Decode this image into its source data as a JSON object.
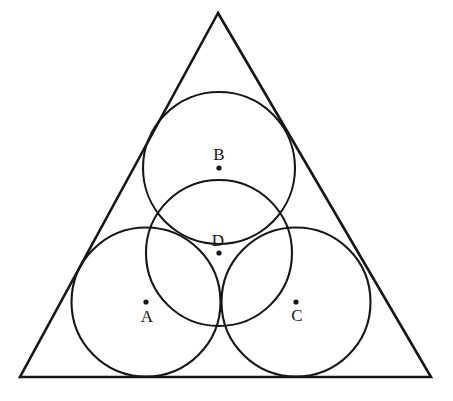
{
  "figure": {
    "background_color": "#ffffff",
    "stroke_color": "#161616",
    "width": 453,
    "height": 401
  },
  "triangle": {
    "name": "equilateral-triangle",
    "stroke_color": "#161616",
    "stroke_width": 2.6,
    "vertices": [
      {
        "name": "apex",
        "x": 218,
        "y": 13
      },
      {
        "name": "bottom-left",
        "x": 20,
        "y": 377
      },
      {
        "name": "bottom-right",
        "x": 431,
        "y": 377
      }
    ],
    "points_path": "218,13 20,377 431,377"
  },
  "circles": [
    {
      "id": "A",
      "label": "A",
      "name": "circle-a",
      "cx": 146,
      "cy": 302,
      "r": 74.5,
      "stroke_width": 2.1,
      "label_x": 147,
      "label_y": 316,
      "dot_r": 2.6
    },
    {
      "id": "B",
      "label": "B",
      "name": "circle-b",
      "cx": 219,
      "cy": 168,
      "r": 76,
      "stroke_width": 2.1,
      "label_x": 219,
      "label_y": 154,
      "dot_r": 2.6
    },
    {
      "id": "C",
      "label": "C",
      "name": "circle-c",
      "cx": 296,
      "cy": 302,
      "r": 74.5,
      "stroke_width": 2.1,
      "label_x": 297,
      "label_y": 315,
      "dot_r": 2.6
    },
    {
      "id": "D",
      "label": "D",
      "name": "circle-d",
      "cx": 219,
      "cy": 253,
      "r": 73,
      "stroke_width": 2.1,
      "label_x": 218,
      "label_y": 240,
      "dot_r": 2.6
    }
  ]
}
